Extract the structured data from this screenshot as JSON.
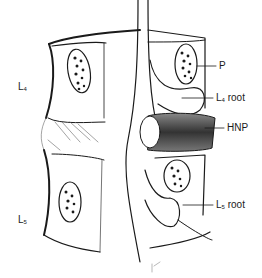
{
  "figure": {
    "title": "",
    "colors": {
      "ink": "#1a1a1a",
      "background": "#ffffff",
      "shade": "#555555"
    }
  },
  "labels": {
    "vertebra_upper": {
      "main": "L",
      "sub": "4"
    },
    "vertebra_lower": {
      "main": "L",
      "sub": "5"
    },
    "pedicle": {
      "text": "P"
    },
    "l4_root": {
      "main": "L",
      "sub": "4",
      "suffix": " root"
    },
    "hnp": {
      "text": "HNP"
    },
    "l5_root": {
      "main": "L",
      "sub": "5",
      "suffix": " root"
    }
  }
}
